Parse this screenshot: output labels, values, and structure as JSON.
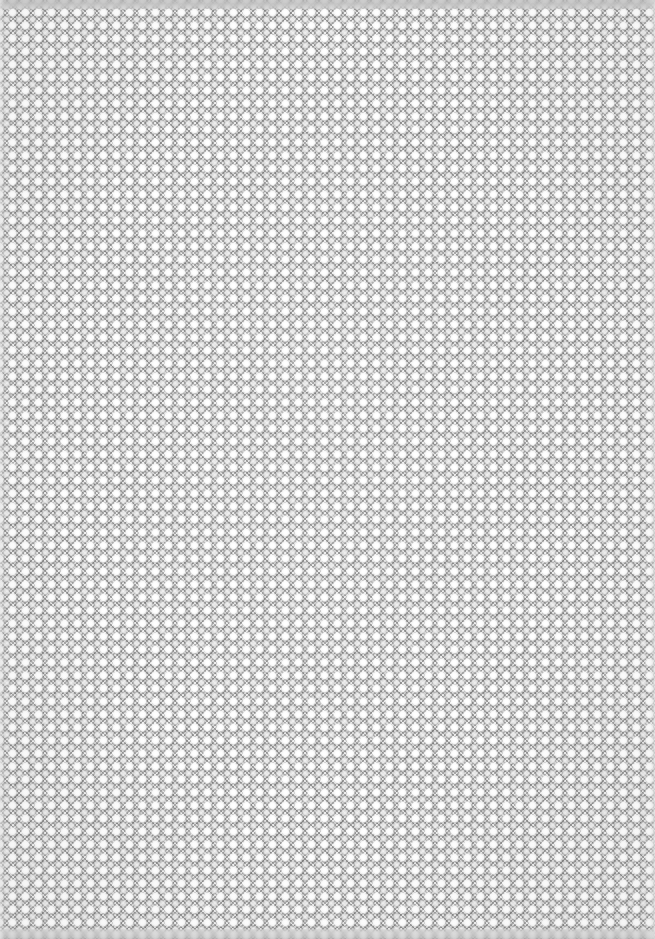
{
  "canvas": {
    "width": 655,
    "height": 939,
    "description": "Seamless decorative halftone dither texture",
    "pattern_type": "checkerboard-dither-halftone",
    "base_color": "#c8c8c8"
  },
  "pattern": {
    "period_px": 13,
    "checker_cell_px": 2,
    "dot_offset_px": 6,
    "diamond_offset_px": 0,
    "hatch_step_px": 4,
    "dot_diameter_px": 5,
    "lattice": "square",
    "diamond_phase": "half-period offset from dots"
  },
  "colors": {
    "checker_light": "#f0f0f0",
    "checker_dark": "#a8a8a8",
    "dot_core": "#ffffff",
    "dot_soft": "#ededed",
    "diamond_core": "#808080",
    "diamond_mid": "#8a8a8a",
    "hatch_color": "#9a9a9a",
    "tone_mid": "#c8c8c8",
    "edge_band": "#b0b0b0",
    "edge_strip": "#e2e2e2"
  },
  "edges": {
    "top_band_height_px": 9,
    "bottom_band_height_px": 10,
    "left_strip_width_px": 6,
    "right_strip_width_px": 6,
    "top_band_style": "blurred",
    "bottom_band_style": "blurred",
    "left_strip_style": "light",
    "right_strip_style": "light"
  }
}
